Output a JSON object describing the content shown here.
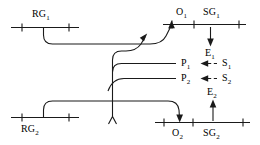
{
  "diagram": {
    "colors": {
      "line": "#1a1a1a",
      "background": "#ffffff",
      "text": "#000000"
    },
    "labels": {
      "rg1": "RG",
      "rg1_sub": "1",
      "rg2": "RG",
      "rg2_sub": "2",
      "o1": "O",
      "o1_sub": "1",
      "o2": "O",
      "o2_sub": "2",
      "sg1": "SG",
      "sg1_sub": "1",
      "sg2": "SG",
      "sg2_sub": "2",
      "p1": "P",
      "p1_sub": "1",
      "p2": "P",
      "p2_sub": "2",
      "s1": "S",
      "s1_sub": "1",
      "s2": "S",
      "s2_sub": "2",
      "e1": "E",
      "e1_sub": "1",
      "e2": "E",
      "e2_sub": "2"
    },
    "nodes": [
      {
        "id": "RG1",
        "label": "RG1",
        "role": "receiving-group-upper",
        "label_position": "above-track"
      },
      {
        "id": "RG2",
        "label": "RG2",
        "role": "receiving-group-lower",
        "label_position": "below-track"
      },
      {
        "id": "O1",
        "label": "O1",
        "role": "outbound-point-upper",
        "label_position": "above-track"
      },
      {
        "id": "O2",
        "label": "O2",
        "role": "outbound-point-lower",
        "label_position": "below-track"
      },
      {
        "id": "SG1",
        "label": "SG1",
        "role": "sorting-group-upper",
        "label_position": "above-track"
      },
      {
        "id": "SG2",
        "label": "SG2",
        "role": "sorting-group-lower",
        "label_position": "below-track"
      },
      {
        "id": "P1",
        "label": "P1",
        "role": "platform-upper",
        "label_position": "right-of-track"
      },
      {
        "id": "P2",
        "label": "P2",
        "role": "platform-lower",
        "label_position": "right-of-track"
      },
      {
        "id": "S1",
        "label": "S1",
        "role": "source-upper"
      },
      {
        "id": "S2",
        "label": "S2",
        "role": "source-lower"
      },
      {
        "id": "E1",
        "label": "E1",
        "role": "exit-upper"
      },
      {
        "id": "E2",
        "label": "E2",
        "role": "exit-lower"
      }
    ],
    "connections": [
      {
        "from": "RG1",
        "to": "O1",
        "style": "solid",
        "arrow": "up-into-track"
      },
      {
        "from": "RG2",
        "to": "O2",
        "style": "solid",
        "arrow": "down-into-track"
      },
      {
        "from": "trunk",
        "to": "P1",
        "style": "solid",
        "arrow": "none"
      },
      {
        "from": "trunk",
        "to": "P2",
        "style": "solid",
        "arrow": "none"
      },
      {
        "from": "S1",
        "to": "P1",
        "style": "dashed",
        "arrow": "left"
      },
      {
        "from": "S2",
        "to": "P2",
        "style": "dashed",
        "arrow": "left"
      },
      {
        "from": "SG1",
        "to": "E1",
        "style": "solid",
        "arrow": "down"
      },
      {
        "from": "E2",
        "to": "SG2",
        "style": "solid",
        "arrow": "up"
      }
    ]
  }
}
